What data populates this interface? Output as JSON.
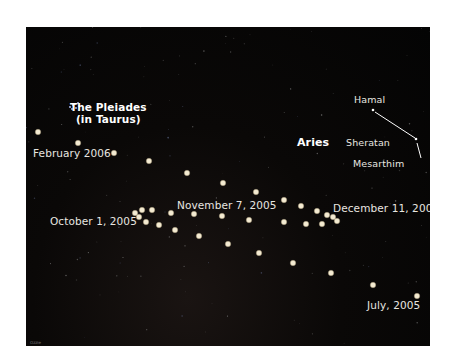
{
  "figure": {
    "background_color": "#050505",
    "dot_color": "#f3ead2"
  },
  "labels": {
    "pleiades_line1": "The Pleiades",
    "pleiades_line2": "(in Taurus)",
    "aries": "Aries",
    "hamal": "Hamal",
    "sheratan": "Sheratan",
    "mesarthim": "Mesarthim",
    "feb_2006": "February 2006",
    "oct_2005": "October 1, 2005",
    "nov_2005": "November 7, 2005",
    "dec_2005": "December 11, 2005",
    "jul_2005": "July, 2005",
    "credit": "Ozzie"
  },
  "mars_positions": [
    {
      "x": 38,
      "y": 132
    },
    {
      "x": 78,
      "y": 143
    },
    {
      "x": 114,
      "y": 153
    },
    {
      "x": 149,
      "y": 161
    },
    {
      "x": 187,
      "y": 173
    },
    {
      "x": 223,
      "y": 183
    },
    {
      "x": 135,
      "y": 213
    },
    {
      "x": 142,
      "y": 210
    },
    {
      "x": 139,
      "y": 217
    },
    {
      "x": 152,
      "y": 210
    },
    {
      "x": 146,
      "y": 222
    },
    {
      "x": 159,
      "y": 225
    },
    {
      "x": 171,
      "y": 213
    },
    {
      "x": 175,
      "y": 230
    },
    {
      "x": 194,
      "y": 214
    },
    {
      "x": 199,
      "y": 236
    },
    {
      "x": 222,
      "y": 216
    },
    {
      "x": 228,
      "y": 244
    },
    {
      "x": 256,
      "y": 192
    },
    {
      "x": 249,
      "y": 220
    },
    {
      "x": 284,
      "y": 200
    },
    {
      "x": 284,
      "y": 222
    },
    {
      "x": 301,
      "y": 206
    },
    {
      "x": 306,
      "y": 224
    },
    {
      "x": 317,
      "y": 211
    },
    {
      "x": 322,
      "y": 224
    },
    {
      "x": 327,
      "y": 215
    },
    {
      "x": 333,
      "y": 217
    },
    {
      "x": 337,
      "y": 221
    },
    {
      "x": 259,
      "y": 253
    },
    {
      "x": 293,
      "y": 263
    },
    {
      "x": 331,
      "y": 273
    },
    {
      "x": 373,
      "y": 285
    },
    {
      "x": 417,
      "y": 296
    }
  ],
  "aries_stars": [
    {
      "name": "Hamal",
      "x": 373,
      "y": 110
    },
    {
      "name": "Sheratan",
      "x": 416,
      "y": 139
    },
    {
      "name": "Mesarthim",
      "x": 421,
      "y": 158
    }
  ]
}
